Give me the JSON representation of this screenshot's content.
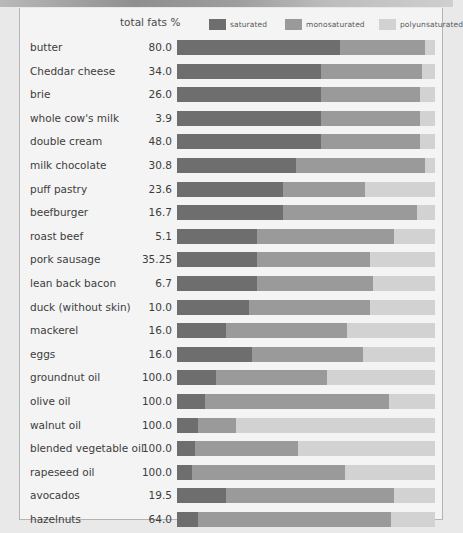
{
  "axis_title": "total fats %",
  "colors": {
    "saturated": "#6e6e6e",
    "monosaturated": "#9a9a9a",
    "polyunsaturated": "#d2d2d2",
    "panel_background": "#f4f4f4",
    "panel_border": "#b4b4b4",
    "page_background": "#e9e9e9",
    "text": "#3d3d3d"
  },
  "legend": [
    {
      "label": "saturated",
      "color": "#6e6e6e"
    },
    {
      "label": "monosaturated",
      "color": "#9a9a9a"
    },
    {
      "label": "polyunsaturated",
      "color": "#d2d2d2"
    }
  ],
  "chart_data": {
    "type": "bar",
    "title": "",
    "subtitle": "",
    "orientation": "horizontal",
    "stacked": true,
    "normalized": true,
    "xlabel": "",
    "ylabel": "",
    "value_column_header": "total fats %",
    "grid": false,
    "legend_position": "top-right",
    "xlim": [
      0,
      100
    ],
    "series": [
      {
        "name": "saturated",
        "color": "#6e6e6e"
      },
      {
        "name": "monosaturated",
        "color": "#9a9a9a"
      },
      {
        "name": "polyunsaturated",
        "color": "#d2d2d2"
      }
    ],
    "categories": [
      "butter",
      "Cheddar cheese",
      "brie",
      "whole cow's milk",
      "double cream",
      "milk chocolate",
      "puff pastry",
      "beefburger",
      "roast beef",
      "pork sausage",
      "lean back bacon",
      "duck (without skin)",
      "mackerel",
      "eggs",
      "groundnut oil",
      "olive oil",
      "walnut oil",
      "blended vegetable oil",
      "rapeseed oil",
      "avocados",
      "hazelnuts"
    ],
    "total_fats_percent": [
      "80.0",
      "34.0",
      "26.0",
      "3.9",
      "48.0",
      "30.8",
      "23.6",
      "16.7",
      "5.1",
      "35.25",
      "6.7",
      "10.0",
      "16.0",
      "16.0",
      "100.0",
      "100.0",
      "100.0",
      "100.0",
      "100.0",
      "19.5",
      "64.0"
    ],
    "rows": [
      {
        "label": "butter",
        "value": "80.0",
        "saturated": 63,
        "monosaturated": 33,
        "polyunsaturated": 4
      },
      {
        "label": "Cheddar cheese",
        "value": "34.0",
        "saturated": 56,
        "monosaturated": 39,
        "polyunsaturated": 5
      },
      {
        "label": "brie",
        "value": "26.0",
        "saturated": 56,
        "monosaturated": 38,
        "polyunsaturated": 6
      },
      {
        "label": "whole cow's milk",
        "value": "3.9",
        "saturated": 56,
        "monosaturated": 38,
        "polyunsaturated": 6
      },
      {
        "label": "double cream",
        "value": "48.0",
        "saturated": 56,
        "monosaturated": 38,
        "polyunsaturated": 6
      },
      {
        "label": "milk chocolate",
        "value": "30.8",
        "saturated": 46,
        "monosaturated": 50,
        "polyunsaturated": 4
      },
      {
        "label": "puff pastry",
        "value": "23.6",
        "saturated": 41,
        "monosaturated": 32,
        "polyunsaturated": 27
      },
      {
        "label": "beefburger",
        "value": "16.7",
        "saturated": 41,
        "monosaturated": 52,
        "polyunsaturated": 7
      },
      {
        "label": "roast beef",
        "value": "5.1",
        "saturated": 31,
        "monosaturated": 53,
        "polyunsaturated": 16
      },
      {
        "label": "pork sausage",
        "value": "35.25",
        "saturated": 31,
        "monosaturated": 44,
        "polyunsaturated": 25
      },
      {
        "label": "lean back bacon",
        "value": "6.7",
        "saturated": 31,
        "monosaturated": 45,
        "polyunsaturated": 24
      },
      {
        "label": "duck (without skin)",
        "value": "10.0",
        "saturated": 28,
        "monosaturated": 47,
        "polyunsaturated": 25
      },
      {
        "label": "mackerel",
        "value": "16.0",
        "saturated": 19,
        "monosaturated": 47,
        "polyunsaturated": 34
      },
      {
        "label": "eggs",
        "value": "16.0",
        "saturated": 29,
        "monosaturated": 43,
        "polyunsaturated": 28
      },
      {
        "label": "groundnut oil",
        "value": "100.0",
        "saturated": 15,
        "monosaturated": 43,
        "polyunsaturated": 42
      },
      {
        "label": "olive oil",
        "value": "100.0",
        "saturated": 11,
        "monosaturated": 71,
        "polyunsaturated": 18
      },
      {
        "label": "walnut oil",
        "value": "100.0",
        "saturated": 8,
        "monosaturated": 15,
        "polyunsaturated": 77
      },
      {
        "label": "blended vegetable oil",
        "value": "100.0",
        "saturated": 7,
        "monosaturated": 40,
        "polyunsaturated": 53
      },
      {
        "label": "rapeseed oil",
        "value": "100.0",
        "saturated": 6,
        "monosaturated": 59,
        "polyunsaturated": 35
      },
      {
        "label": "avocados",
        "value": "19.5",
        "saturated": 19,
        "monosaturated": 65,
        "polyunsaturated": 16
      },
      {
        "label": "hazelnuts",
        "value": "64.0",
        "saturated": 8,
        "monosaturated": 75,
        "polyunsaturated": 17
      }
    ]
  }
}
